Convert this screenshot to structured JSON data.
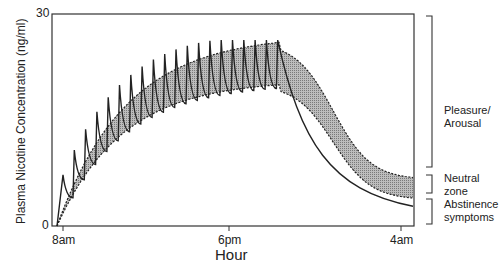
{
  "chart_data": {
    "type": "line",
    "title": "",
    "xlabel": "Hour",
    "ylabel": "Plasma Nicotine Concentration (ng/ml)",
    "ylim": [
      0,
      30
    ],
    "y_ticks": [
      "0",
      "30"
    ],
    "x_ticks": [
      "8am",
      "6pm",
      "4am"
    ],
    "grid": false,
    "series": [
      {
        "name": "Plasma nicotine (smoking, sawtooth)",
        "style": "solid",
        "description": "Sawtooth rising from 0 at 8am; each cigarette spikes ~+5 ng/ml then decays; peaks climb to ~26 and troughs to ~20 by ~11pm, then exponential decline to ~3 by 4am",
        "x_hours_from_8am": [
          0,
          1,
          2,
          4,
          6,
          8,
          10,
          12,
          14,
          15,
          16,
          18,
          20
        ],
        "values": [
          0,
          9,
          13,
          17,
          20,
          22,
          23,
          25,
          26,
          20,
          14,
          7,
          3
        ]
      },
      {
        "name": "Upper band (Pleasure/Arousal threshold)",
        "style": "dotted",
        "x_hours_from_8am": [
          0,
          2,
          4,
          6,
          8,
          10,
          12,
          14,
          15,
          16,
          18,
          20
        ],
        "values": [
          0,
          12,
          17,
          21,
          23,
          25,
          26,
          26,
          25,
          21,
          13,
          9
        ]
      },
      {
        "name": "Lower band (Neutral zone threshold)",
        "style": "dotted",
        "x_hours_from_8am": [
          0,
          2,
          4,
          6,
          8,
          10,
          12,
          14,
          15,
          16,
          18,
          20
        ],
        "values": [
          0,
          7,
          12,
          16,
          18,
          19.5,
          20,
          20,
          19,
          16,
          9,
          5
        ]
      }
    ],
    "annotations": [
      "Pleasure/ Arousal",
      "Neutral zone",
      "Abstinence symptoms"
    ]
  },
  "axes": {
    "y_max": "30",
    "y_min": "0",
    "x_ticks": [
      "8am",
      "6pm",
      "4am"
    ],
    "xlabel": "Hour",
    "ylabel": "Plasma Nicotine Concentration (ng/ml)"
  },
  "zones": {
    "pleasure": [
      "Pleasure/",
      "Arousal"
    ],
    "neutral": [
      "Neutral",
      "zone"
    ],
    "abstinence": [
      "Abstinence",
      "symptoms"
    ]
  },
  "colors": {
    "band": "#a9a9a9",
    "line": "#222222",
    "frame": "#333333"
  }
}
